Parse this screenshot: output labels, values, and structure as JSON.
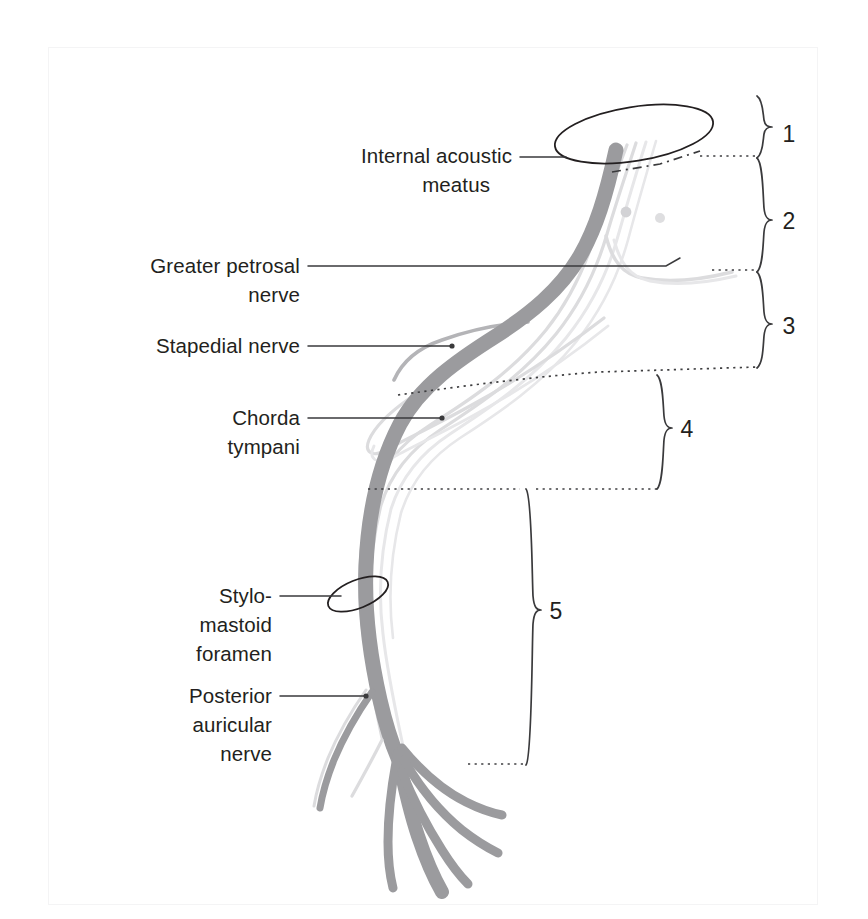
{
  "figure": {
    "background_color": "#ffffff",
    "frame_color": "#f4f4f5"
  },
  "colors": {
    "nerve_dark": "#9b9b9e",
    "nerve_mid": "#b4b4b7",
    "nerve_pale": "#dcdcde",
    "line": "#3a3a3c",
    "text": "#231f20"
  },
  "labels": [
    {
      "id": "internal-acoustic-meatus",
      "lines": [
        "Internal acoustic",
        "meatus"
      ],
      "align": "end",
      "x": 512,
      "y": 162,
      "leader": {
        "from": [
          520,
          157
        ],
        "to": [
          562,
          157
        ]
      }
    },
    {
      "id": "greater-petrosal-nerve",
      "lines": [
        "Greater petrosal",
        "nerve"
      ],
      "align": "end",
      "x": 300,
      "y": 272,
      "leader": {
        "from": [
          308,
          266
        ],
        "to": [
          666,
          266
        ]
      }
    },
    {
      "id": "stapedial-nerve",
      "lines": [
        "Stapedial nerve"
      ],
      "align": "end",
      "x": 300,
      "y": 352,
      "leader": {
        "from": [
          308,
          346
        ],
        "to": [
          452,
          346
        ]
      }
    },
    {
      "id": "chorda-tympani",
      "lines": [
        "Chorda",
        "tympani"
      ],
      "align": "end",
      "x": 300,
      "y": 424,
      "leader": {
        "from": [
          308,
          418
        ],
        "to": [
          442,
          418
        ]
      }
    },
    {
      "id": "stylomastoid-foramen",
      "lines": [
        "Stylo-",
        "mastoid",
        "foramen"
      ],
      "align": "end",
      "x": 272,
      "y": 602,
      "leader": {
        "from": [
          280,
          596
        ],
        "to": [
          345,
          596
        ]
      }
    },
    {
      "id": "posterior-auricular-nerve",
      "lines": [
        "Posterior",
        "auricular",
        "nerve"
      ],
      "align": "end",
      "x": 272,
      "y": 702,
      "leader": {
        "from": [
          280,
          696
        ],
        "to": [
          366,
          696
        ]
      }
    }
  ],
  "brackets": [
    {
      "number": "1",
      "top": 96,
      "bottom": 158,
      "x": 760,
      "label_x": 789,
      "label_y": 134
    },
    {
      "number": "2",
      "top": 158,
      "bottom": 272,
      "x": 760,
      "label_x": 789,
      "label_y": 222
    },
    {
      "number": "3",
      "top": 272,
      "bottom": 368,
      "x": 760,
      "label_x": 789,
      "label_y": 328
    },
    {
      "number": "4",
      "top": 375,
      "bottom": 489,
      "x": 660,
      "label_x": 687,
      "label_y": 432
    },
    {
      "number": "5",
      "top": 489,
      "bottom": 765,
      "x": 529,
      "label_x": 556,
      "label_y": 614
    }
  ],
  "guide_lines": [
    {
      "id": "guide-1-2",
      "type": "dotted",
      "points": [
        [
          700,
          156
        ],
        [
          757,
          156
        ]
      ]
    },
    {
      "id": "guide-2-3",
      "type": "dotted",
      "points": [
        [
          712,
          270
        ],
        [
          757,
          270
        ]
      ]
    },
    {
      "id": "guide-3-4",
      "type": "dotted",
      "points": [
        [
          398,
          395
        ],
        [
          600,
          373
        ],
        [
          757,
          368
        ]
      ]
    },
    {
      "id": "guide-4-5",
      "type": "dotted",
      "points": [
        [
          368,
          489
        ],
        [
          657,
          489
        ]
      ]
    },
    {
      "id": "guide-5-bottom",
      "type": "dotted",
      "points": [
        [
          468,
          764
        ],
        [
          526,
          764
        ]
      ]
    },
    {
      "id": "guide-dashdot-top",
      "type": "dash-dot",
      "points": [
        [
          612,
          170
        ],
        [
          700,
          152
        ]
      ]
    }
  ],
  "annotations": {
    "meatus_ellipse": "internal acoustic meatus opening",
    "foramen_ellipse": "stylomastoid foramen opening",
    "geniculate_ganglion": "geniculate ganglion nodules"
  }
}
